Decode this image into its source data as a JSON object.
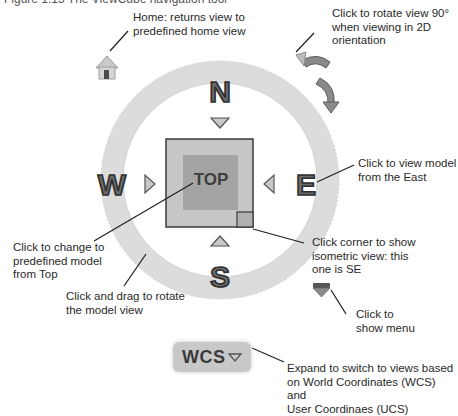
{
  "caption_fragment": "Figure 1.15 The ViewCube navigation tool",
  "viewcube": {
    "compass": {
      "north": "N",
      "south": "S",
      "east": "E",
      "west": "W"
    },
    "face_label": "TOP",
    "coordinate_system_button": {
      "label": "WCS"
    }
  },
  "callouts": {
    "home": "Home: returns view to\npredefined home view",
    "rotate": "Click to rotate view 90°\nwhen viewing in 2D\norientation",
    "east": "Click to view model\nfrom the East",
    "top": "Click to change to\npredefined model\nfrom Top",
    "corner": "Click corner to show\nisometric view: this\none is SE",
    "ring": "Click and drag to rotate\nthe model view",
    "menu": "Click to\nshow menu",
    "wcs": "Expand to switch to views based\non World Coordinates (WCS) and\nUser Coordinaes (UCS)"
  },
  "colors": {
    "ring": "#dedede",
    "ring_edge": "#c9c9c9",
    "cube_outer": "#c4c4c4",
    "cube_inner": "#a6a6a6",
    "letter_fill": "#6a6a6a",
    "letter_stroke": "#2e2e2e",
    "arrow_fill": "#8a8a8a",
    "leader": "#1f1f1f"
  }
}
